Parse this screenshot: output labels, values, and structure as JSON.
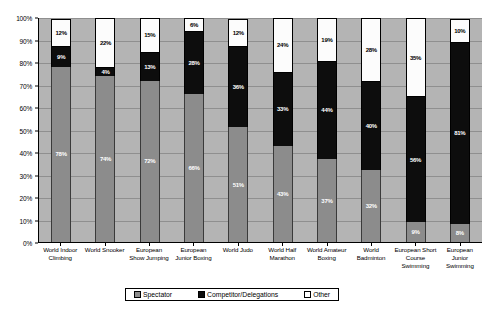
{
  "chart_data": {
    "type": "bar",
    "subtype": "stacked-percentage",
    "title": "",
    "xlabel": "",
    "ylabel": "",
    "ylim": [
      0,
      100
    ],
    "ytick_labels": [
      "0%",
      "10%",
      "20%",
      "30%",
      "40%",
      "50%",
      "60%",
      "70%",
      "80%",
      "90%",
      "100%"
    ],
    "ytick_values": [
      0,
      10,
      20,
      30,
      40,
      50,
      60,
      70,
      80,
      90,
      100
    ],
    "grid": true,
    "legend_position": "bottom",
    "categories": [
      "World Indoor Climbing",
      "World Snooker",
      "European Show Jumping",
      "European Junior Boxing",
      "World Judo",
      "World Half Marathon",
      "World Amateur Boxing",
      "World Badminton",
      "European Short Course Swimming",
      "European Junior Swimming"
    ],
    "series": [
      {
        "name": "Spectator",
        "color": "#8c8c8c",
        "values": [
          78,
          74,
          72,
          66,
          51,
          43,
          37,
          32,
          9,
          8
        ],
        "labels": [
          "78%",
          "74%",
          "72%",
          "66%",
          "51%",
          "43%",
          "37%",
          "32%",
          "9%",
          "8%"
        ]
      },
      {
        "name": "Competitor/Delegations",
        "color": "#0d0d0d",
        "values": [
          9,
          4,
          13,
          28,
          36,
          33,
          44,
          40,
          56,
          81
        ],
        "labels": [
          "9%",
          "4%",
          "13%",
          "28%",
          "36%",
          "33%",
          "44%",
          "40%",
          "56%",
          "81%"
        ]
      },
      {
        "name": "Other",
        "color": "#ffffff",
        "values": [
          12,
          22,
          15,
          6,
          12,
          24,
          19,
          28,
          35,
          10
        ],
        "labels": [
          "12%",
          "22%",
          "15%",
          "6%",
          "12%",
          "24%",
          "19%",
          "28%",
          "35%",
          "10%"
        ]
      }
    ]
  },
  "legend": {
    "items": [
      {
        "label": "Spectator"
      },
      {
        "label": "Competitor/Delegations"
      },
      {
        "label": "Other"
      }
    ]
  }
}
